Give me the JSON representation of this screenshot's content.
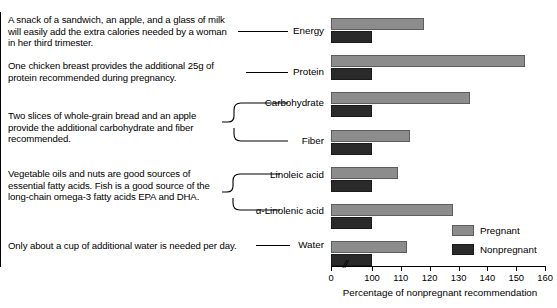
{
  "annotations": [
    {
      "id": "ann-0",
      "text": "A snack of a sandwich, an apple, and a glass of milk will easily add the extra calories needed by a woman in her third trimester."
    },
    {
      "id": "ann-1",
      "text": "One chicken breast provides the additional 25g of protein recommended during pregnancy."
    },
    {
      "id": "ann-2",
      "text": "Two slices of whole-grain bread and an apple provide the additional carbohydrate and fiber recommended."
    },
    {
      "id": "ann-3",
      "text": "Vegetable oils and nuts are good sources of essential fatty acids. Fish is a good source of the long-chain omega-3 fatty acids EPA and DHA."
    },
    {
      "id": "ann-4",
      "text": "Only about a cup of additional water is needed per day."
    }
  ],
  "legend": {
    "items": [
      {
        "label": "Pregnant",
        "color": "#8c8c8c"
      },
      {
        "label": "Nonpregnant",
        "color": "#2a2a2a"
      }
    ]
  },
  "axis": {
    "break_symbol": "//",
    "title": "Percentage of nonpregnant recommendation"
  },
  "chart_data": {
    "type": "bar",
    "orientation": "horizontal",
    "title": "",
    "xlabel": "Percentage of nonpregnant recommendation",
    "ylabel": "",
    "categories": [
      "Energy",
      "Protein",
      "Carbohydrate",
      "Fiber",
      "Linoleic acid",
      "α-Linolenic acid",
      "Water"
    ],
    "series": [
      {
        "name": "Pregnant",
        "color": "#8c8c8c",
        "values": [
          118,
          153,
          134,
          113,
          109,
          128,
          112
        ]
      },
      {
        "name": "Nonpregnant",
        "color": "#2a2a2a",
        "values": [
          100,
          100,
          100,
          100,
          100,
          100,
          100
        ]
      }
    ],
    "xlim": [
      0,
      160
    ],
    "xticks": [
      0,
      100,
      110,
      120,
      130,
      140,
      150,
      160
    ],
    "xtick_labels": [
      "0",
      "100",
      "110",
      "120",
      "130",
      "140",
      "150",
      "160"
    ],
    "axis_break_after": 0,
    "grid": false,
    "legend_position": "bottom-right"
  }
}
